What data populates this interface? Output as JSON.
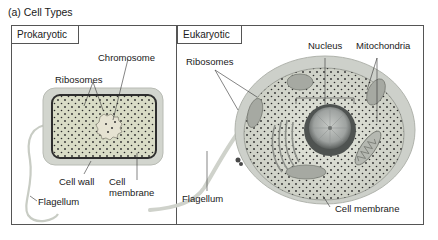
{
  "figure": {
    "title": "(a) Cell Types",
    "colors": {
      "frame": "#555555",
      "cytoplasm": "#d9dcc8",
      "cell_wall": "#cfd2cb",
      "membrane": "#3a3a3a",
      "ribosome": "#2a2a2a",
      "nucleus": "#9aa0a0",
      "mitochondria": "#a8aaa4"
    },
    "panels": [
      {
        "name": "Prokaryotic",
        "labels": [
          "Chromosome",
          "Ribosomes",
          "Cell wall",
          "Cell membrane",
          "Flagellum"
        ]
      },
      {
        "name": "Eukaryotic",
        "labels": [
          "Nucleus",
          "Mitochondria",
          "Ribosomes",
          "Flagellum",
          "Cell membrane"
        ]
      }
    ],
    "prokaryotic": {
      "header": "Prokaryotic",
      "chromosome": "Chromosome",
      "ribosomes": "Ribosomes",
      "cell_wall": "Cell wall",
      "cell_membrane_line1": "Cell",
      "cell_membrane_line2": "membrane",
      "flagellum": "Flagellum"
    },
    "eukaryotic": {
      "header": "Eukaryotic",
      "nucleus": "Nucleus",
      "mitochondria": "Mitochondria",
      "ribosomes": "Ribosomes",
      "flagellum": "Flagellum",
      "cell_membrane": "Cell membrane"
    }
  }
}
